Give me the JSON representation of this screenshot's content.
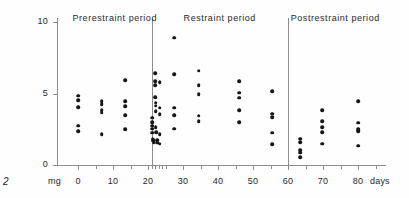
{
  "figure": {
    "number": "2",
    "unit_label": "mg",
    "days_label": "days"
  },
  "chart_data": {
    "type": "scatter",
    "title": "",
    "xlabel": "days",
    "ylabel": "mg",
    "xlim": [
      -6,
      88
    ],
    "ylim": [
      0,
      10
    ],
    "grid": false,
    "legend_position": "none",
    "y_ticks": [
      0,
      5,
      10
    ],
    "y_tick_labels": [
      "0",
      "5",
      "10"
    ],
    "x_ticks": [
      0,
      5,
      10,
      15,
      20,
      21,
      22,
      23,
      24,
      25,
      30,
      35,
      40,
      45,
      50,
      55,
      60,
      65,
      70,
      75,
      80,
      85
    ],
    "x_tick_labels": [
      {
        "value": 0,
        "label": "0"
      },
      {
        "value": 10,
        "label": "10"
      },
      {
        "value": 20,
        "label": "20"
      },
      {
        "value": 30,
        "label": "30"
      },
      {
        "value": 40,
        "label": "40"
      },
      {
        "value": 50,
        "label": "50"
      },
      {
        "value": 60,
        "label": "60"
      },
      {
        "value": 70,
        "label": "70"
      },
      {
        "value": 80,
        "label": "80"
      }
    ],
    "annotations": [
      {
        "name": "prerestraint",
        "label": "Prerestraint period",
        "center_day": 10.5
      },
      {
        "name": "restraint",
        "label": "Restraint  period",
        "center_day": 40.5
      },
      {
        "name": "postrestraint",
        "label": "Postrestraint  period",
        "center_day": 73.5
      }
    ],
    "dividers": [
      21,
      60
    ],
    "series": [
      {
        "name": "urinary excretion",
        "marker": "filled-circle",
        "color": "#151515",
        "points": [
          [
            0,
            4.85
          ],
          [
            0,
            4.55
          ],
          [
            0,
            4.05
          ],
          [
            0,
            2.75
          ],
          [
            0,
            2.35
          ],
          [
            6.8,
            4.45
          ],
          [
            6.8,
            4.25
          ],
          [
            6.8,
            3.85
          ],
          [
            6.8,
            3.65
          ],
          [
            6.8,
            2.15
          ],
          [
            13.5,
            5.95
          ],
          [
            13.5,
            4.45
          ],
          [
            13.5,
            4.1
          ],
          [
            13.5,
            3.5
          ],
          [
            13.5,
            2.5
          ],
          [
            21.2,
            3.3
          ],
          [
            21.2,
            3.0
          ],
          [
            21.2,
            2.75
          ],
          [
            21.2,
            2.55
          ],
          [
            21.2,
            2.25
          ],
          [
            21.4,
            1.8
          ],
          [
            21.4,
            1.7
          ],
          [
            21.6,
            1.75
          ],
          [
            21.6,
            1.6
          ],
          [
            22.0,
            6.4
          ],
          [
            22.0,
            5.85
          ],
          [
            22.0,
            5.6
          ],
          [
            22.0,
            4.75
          ],
          [
            22.2,
            4.35
          ],
          [
            22.2,
            4.15
          ],
          [
            22.2,
            3.75
          ],
          [
            22.2,
            2.65
          ],
          [
            22.4,
            2.3
          ],
          [
            22.6,
            1.75
          ],
          [
            22.6,
            1.55
          ],
          [
            23.3,
            5.8
          ],
          [
            23.3,
            4.0
          ],
          [
            23.3,
            3.55
          ],
          [
            23.3,
            2.15
          ],
          [
            23.3,
            1.5
          ],
          [
            27.5,
            8.9
          ],
          [
            27.5,
            6.35
          ],
          [
            27.5,
            4.0
          ],
          [
            27.5,
            3.5
          ],
          [
            27.5,
            2.55
          ],
          [
            34.5,
            6.6
          ],
          [
            34.5,
            5.6
          ],
          [
            34.5,
            4.95
          ],
          [
            34.5,
            3.45
          ],
          [
            34.5,
            3.05
          ],
          [
            46.0,
            5.85
          ],
          [
            46.0,
            5.05
          ],
          [
            46.0,
            4.7
          ],
          [
            46.0,
            3.85
          ],
          [
            46.0,
            3.0
          ],
          [
            55.5,
            5.15
          ],
          [
            55.5,
            3.6
          ],
          [
            55.5,
            3.35
          ],
          [
            55.5,
            2.25
          ],
          [
            55.5,
            1.45
          ],
          [
            63.5,
            1.85
          ],
          [
            63.5,
            1.6
          ],
          [
            63.5,
            1.05
          ],
          [
            63.5,
            0.85
          ],
          [
            63.5,
            0.55
          ],
          [
            69.8,
            3.85
          ],
          [
            69.8,
            3.05
          ],
          [
            69.8,
            2.65
          ],
          [
            69.8,
            2.3
          ],
          [
            69.8,
            1.5
          ],
          [
            80.0,
            4.45
          ],
          [
            80.0,
            2.95
          ],
          [
            80.0,
            2.5
          ],
          [
            80.0,
            2.35
          ],
          [
            80.0,
            1.35
          ]
        ]
      }
    ]
  }
}
